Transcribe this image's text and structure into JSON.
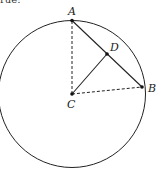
{
  "caption_fragment": "rue:",
  "circle": {
    "center": "C",
    "stroke": "#222222"
  },
  "points": [
    {
      "name": "A",
      "label": "A"
    },
    {
      "name": "B",
      "label": "B"
    },
    {
      "name": "C",
      "label": "C"
    },
    {
      "name": "D",
      "label": "D"
    }
  ],
  "segments": [
    {
      "from": "C",
      "to": "A",
      "style": "dashed"
    },
    {
      "from": "C",
      "to": "B",
      "style": "dashed"
    },
    {
      "from": "A",
      "to": "B",
      "style": "solid"
    },
    {
      "from": "C",
      "to": "D",
      "style": "solid"
    }
  ]
}
